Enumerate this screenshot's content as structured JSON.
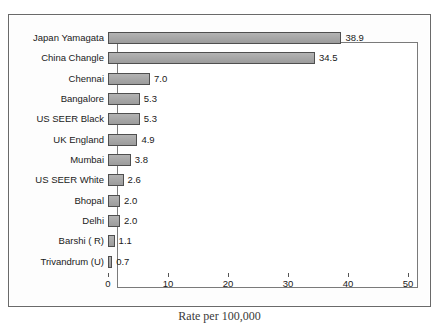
{
  "chart_data": {
    "type": "bar",
    "orientation": "horizontal",
    "title": "",
    "xlabel": "Rate per 100,000",
    "ylabel": "",
    "xlim": [
      0,
      50
    ],
    "xticks": [
      0,
      10,
      20,
      30,
      40,
      50
    ],
    "grid": false,
    "legend": null,
    "categories": [
      "Japan Yamagata",
      "China Changle",
      "Chennai",
      "Bangalore",
      "US SEER Black",
      "UK England",
      "Mumbai",
      "US SEER White",
      "Bhopal",
      "Delhi",
      "Barshi ( R)",
      "Trivandrum (U)"
    ],
    "values": [
      38.9,
      34.5,
      7.0,
      5.3,
      5.3,
      4.9,
      3.8,
      2.6,
      2.0,
      2.0,
      1.1,
      0.7
    ],
    "value_labels": [
      "38.9",
      "34.5",
      "7.0",
      "5.3",
      "5.3",
      "4.9",
      "3.8",
      "2.6",
      "2.0",
      "2.0",
      "1.1",
      "0.7"
    ],
    "bar_color": "#a6a6a6",
    "bar_border_color": "#4f4f4f",
    "axis_color": "#555555",
    "background_color": "#ffffff"
  },
  "caption": {
    "bottom": "Rate per 100,000"
  }
}
